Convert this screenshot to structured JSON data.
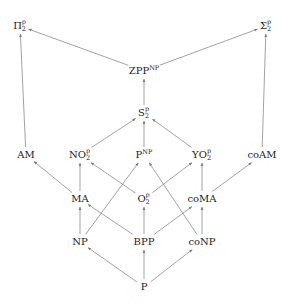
{
  "diagram": {
    "type": "complexity-class-inclusion-diagram",
    "edge_color": "#7a7a7a",
    "text_color": "#222222",
    "nodes": [
      {
        "id": "Pi2",
        "base": "Π",
        "sup": "p",
        "sub": "2",
        "label": "Π2p",
        "x": 20,
        "y": 26
      },
      {
        "id": "Sigma2",
        "base": "Σ",
        "sup": "p",
        "sub": "2",
        "label": "Σ2p",
        "x": 266,
        "y": 26
      },
      {
        "id": "ZPPNP",
        "base": "ZPP",
        "sup": "NP",
        "sub": "",
        "label": "ZPP^NP",
        "x": 144,
        "y": 71
      },
      {
        "id": "S2",
        "base": "S",
        "sup": "p",
        "sub": "2",
        "label": "S2p",
        "x": 144,
        "y": 113
      },
      {
        "id": "AM",
        "base": "AM",
        "sup": "",
        "sub": "",
        "label": "AM",
        "x": 26,
        "y": 155
      },
      {
        "id": "NO2",
        "base": "NO",
        "sup": "p",
        "sub": "2",
        "label": "NO2p",
        "x": 80,
        "y": 155
      },
      {
        "id": "PNP",
        "base": "P",
        "sup": "NP",
        "sub": "",
        "label": "P^NP",
        "x": 144,
        "y": 155
      },
      {
        "id": "YO2",
        "base": "YO",
        "sup": "p",
        "sub": "2",
        "label": "YO2p",
        "x": 202,
        "y": 155
      },
      {
        "id": "coAM",
        "base": "coAM",
        "sup": "",
        "sub": "",
        "label": "coAM",
        "x": 262,
        "y": 155
      },
      {
        "id": "MA",
        "base": "MA",
        "sup": "",
        "sub": "",
        "label": "MA",
        "x": 80,
        "y": 199
      },
      {
        "id": "O2",
        "base": "O",
        "sup": "p",
        "sub": "2",
        "label": "O2p",
        "x": 144,
        "y": 199
      },
      {
        "id": "coMA",
        "base": "coMA",
        "sup": "",
        "sub": "",
        "label": "coMA",
        "x": 202,
        "y": 199
      },
      {
        "id": "NP",
        "base": "NP",
        "sup": "",
        "sub": "",
        "label": "NP",
        "x": 80,
        "y": 242
      },
      {
        "id": "BPP",
        "base": "BPP",
        "sup": "",
        "sub": "",
        "label": "BPP",
        "x": 144,
        "y": 242
      },
      {
        "id": "coNP",
        "base": "coNP",
        "sup": "",
        "sub": "",
        "label": "coNP",
        "x": 202,
        "y": 242
      },
      {
        "id": "P",
        "base": "P",
        "sup": "",
        "sub": "",
        "label": "P",
        "x": 144,
        "y": 287
      }
    ],
    "edges": [
      {
        "from": "ZPPNP",
        "to": "Pi2"
      },
      {
        "from": "ZPPNP",
        "to": "Sigma2"
      },
      {
        "from": "S2",
        "to": "ZPPNP"
      },
      {
        "from": "NO2",
        "to": "S2"
      },
      {
        "from": "PNP",
        "to": "S2"
      },
      {
        "from": "YO2",
        "to": "S2"
      },
      {
        "from": "AM",
        "to": "Pi2"
      },
      {
        "from": "coAM",
        "to": "Sigma2"
      },
      {
        "from": "MA",
        "to": "AM"
      },
      {
        "from": "MA",
        "to": "NO2"
      },
      {
        "from": "O2",
        "to": "NO2"
      },
      {
        "from": "O2",
        "to": "YO2"
      },
      {
        "from": "coMA",
        "to": "YO2"
      },
      {
        "from": "coMA",
        "to": "coAM"
      },
      {
        "from": "NP",
        "to": "MA"
      },
      {
        "from": "NP",
        "to": "PNP"
      },
      {
        "from": "BPP",
        "to": "MA"
      },
      {
        "from": "BPP",
        "to": "O2"
      },
      {
        "from": "BPP",
        "to": "coMA"
      },
      {
        "from": "coNP",
        "to": "coMA"
      },
      {
        "from": "coNP",
        "to": "PNP"
      },
      {
        "from": "P",
        "to": "NP"
      },
      {
        "from": "P",
        "to": "BPP"
      },
      {
        "from": "P",
        "to": "coNP"
      }
    ]
  }
}
